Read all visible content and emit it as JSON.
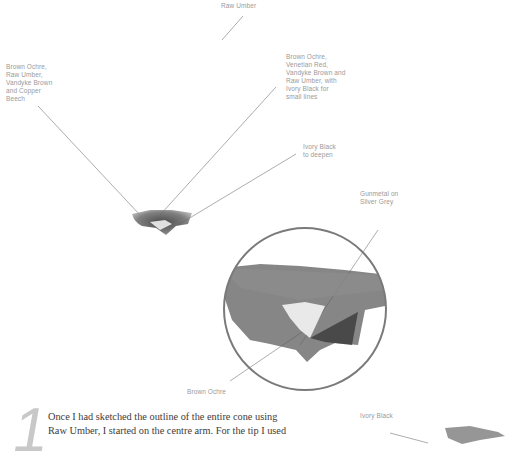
{
  "annotations": {
    "raw_umber_top": "Raw Umber",
    "left_label": "Brown Ochre,\nRaw Umber,\nVandyke Brown\nand Copper\nBeech",
    "right_label": "Brown Ochre,\nVenetian Red,\nVandyke Brown and\nRaw Umber, with\nIvory Black for\nsmall lines",
    "ivory_black_deepen": "Ivory Black\nto deepen",
    "gunmetal": "Gunmetal on\nSilver Grey",
    "brown_ochre_bottom": "Brown Ochre",
    "ivory_black_bottom": "Ivory Black"
  },
  "step": {
    "number": "1",
    "lines": [
      "Once I had sketched the outline of the entire cone using",
      "Raw Umber, I started on the centre arm. For the tip I used"
    ]
  },
  "colors": {
    "label_text": "#9a9a9a",
    "leader_line": "#8a8a8a",
    "circle": "#7a7a7a",
    "step_number": "#c8c8c8",
    "body_text": "#3c3c3c"
  }
}
